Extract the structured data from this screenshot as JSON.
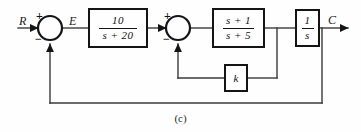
{
  "figure": {
    "caption": "(c)",
    "type": "control-system-block-diagram",
    "line_color": "#333333",
    "block_border_color": "#141414",
    "background_color": "#fefefe"
  },
  "signals": {
    "input_label": "R",
    "error_label": "E",
    "output_label": "C"
  },
  "summing_junctions": [
    {
      "id": "summer-1",
      "positive_sign": "+",
      "negative_sign": "−",
      "cx": 50,
      "cy": 28
    },
    {
      "id": "summer-2",
      "positive_sign": "+",
      "negative_sign": "−",
      "cx": 178,
      "cy": 28
    }
  ],
  "blocks": [
    {
      "id": "block-forward-1",
      "kind": "fraction",
      "numerator": "10",
      "denominator": "s + 20"
    },
    {
      "id": "block-forward-2",
      "kind": "fraction",
      "numerator": "s + 1",
      "denominator": "s + 5"
    },
    {
      "id": "block-integrator",
      "kind": "fraction",
      "numerator": "1",
      "denominator": "s"
    },
    {
      "id": "block-gain-k",
      "kind": "symbol",
      "symbol": "k"
    }
  ]
}
